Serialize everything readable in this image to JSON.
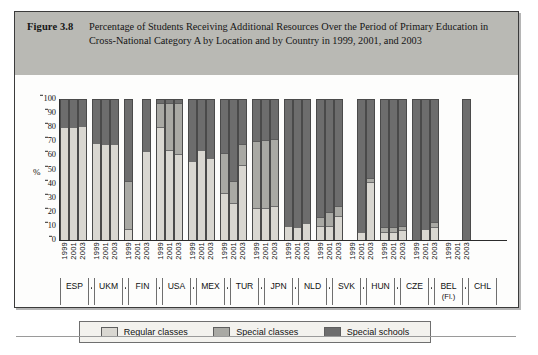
{
  "figure": {
    "number_label": "Figure 3.8",
    "title": "Percentage of Students Receiving Additional Resources Over the Period of Primary Education in Cross-National Category A by Location and by Country in 1999, 2001, and 2003"
  },
  "legend": {
    "items": [
      {
        "label": "Regular classes",
        "color": "#d9d7d1",
        "icon": "legend-swatch-icon"
      },
      {
        "label": "Special classes",
        "color": "#a9a9a4",
        "icon": "legend-swatch-icon"
      },
      {
        "label": "Special schools",
        "color": "#6d6d6d",
        "icon": "legend-swatch-icon"
      }
    ]
  },
  "chart_data": {
    "type": "bar",
    "subtype": "stacked-percentage",
    "title": "Percentage of Students Receiving Additional Resources Over the Period of Primary Education in Cross-National Category A by Location and by Country in 1999, 2001, and 2003",
    "xlabel": "",
    "ylabel": "%",
    "ylim": [
      0,
      100
    ],
    "yticks": [
      0,
      10,
      20,
      30,
      40,
      50,
      60,
      70,
      80,
      90,
      100
    ],
    "grid": false,
    "legend_position": "bottom",
    "categories": [
      "ESP",
      "UKM",
      "FIN",
      "USA",
      "MEX",
      "TUR",
      "JPN",
      "NLD",
      "SVK",
      "HUN",
      "CZE",
      "BEL (Fl.)",
      "CHL"
    ],
    "years": [
      "1999",
      "2001",
      "2003"
    ],
    "series": [
      {
        "name": "Regular classes",
        "color": "#d9d7d1"
      },
      {
        "name": "Special classes",
        "color": "#a9a9a4"
      },
      {
        "name": "Special schools",
        "color": "#6d6d6d"
      }
    ],
    "groups": [
      {
        "category": "ESP",
        "bars": [
          {
            "year": "1999",
            "regular": 80,
            "special_classes": 0,
            "special_schools": 20
          },
          {
            "year": "2001",
            "regular": 80,
            "special_classes": 0,
            "special_schools": 20
          },
          {
            "year": "2003",
            "regular": 81,
            "special_classes": 0,
            "special_schools": 19
          }
        ]
      },
      {
        "category": "UKM",
        "bars": [
          {
            "year": "1999",
            "regular": 69,
            "special_classes": 0,
            "special_schools": 31
          },
          {
            "year": "2001",
            "regular": 68,
            "special_classes": 0,
            "special_schools": 32
          },
          {
            "year": "2003",
            "regular": 68,
            "special_classes": 0,
            "special_schools": 32
          }
        ]
      },
      {
        "category": "FIN",
        "bars": [
          {
            "year": "1999",
            "regular": 8,
            "special_classes": 34,
            "special_schools": 58
          },
          {
            "year": "2001",
            "regular": 0,
            "special_classes": 0,
            "special_schools": 0
          },
          {
            "year": "2003",
            "regular": 63,
            "special_classes": 0,
            "special_schools": 37
          }
        ]
      },
      {
        "category": "USA",
        "bars": [
          {
            "year": "1999",
            "regular": 80,
            "special_classes": 17,
            "special_schools": 3
          },
          {
            "year": "2001",
            "regular": 64,
            "special_classes": 33,
            "special_schools": 3
          },
          {
            "year": "2003",
            "regular": 61,
            "special_classes": 36,
            "special_schools": 3
          }
        ]
      },
      {
        "category": "MEX",
        "bars": [
          {
            "year": "1999",
            "regular": 56,
            "special_classes": 0,
            "special_schools": 44
          },
          {
            "year": "2001",
            "regular": 64,
            "special_classes": 0,
            "special_schools": 36
          },
          {
            "year": "2003",
            "regular": 58,
            "special_classes": 0,
            "special_schools": 42
          }
        ]
      },
      {
        "category": "TUR",
        "bars": [
          {
            "year": "1999",
            "regular": 33,
            "special_classes": 29,
            "special_schools": 38
          },
          {
            "year": "2001",
            "regular": 26,
            "special_classes": 16,
            "special_schools": 58
          },
          {
            "year": "2003",
            "regular": 53,
            "special_classes": 15,
            "special_schools": 32
          }
        ]
      },
      {
        "category": "JPN",
        "bars": [
          {
            "year": "1999",
            "regular": 23,
            "special_classes": 47,
            "special_schools": 30
          },
          {
            "year": "2001",
            "regular": 23,
            "special_classes": 48,
            "special_schools": 29
          },
          {
            "year": "2003",
            "regular": 24,
            "special_classes": 48,
            "special_schools": 28
          }
        ]
      },
      {
        "category": "NLD",
        "bars": [
          {
            "year": "1999",
            "regular": 10,
            "special_classes": 0,
            "special_schools": 90
          },
          {
            "year": "2001",
            "regular": 9,
            "special_classes": 0,
            "special_schools": 91
          },
          {
            "year": "2003",
            "regular": 12,
            "special_classes": 0,
            "special_schools": 88
          }
        ]
      },
      {
        "category": "SVK",
        "bars": [
          {
            "year": "1999",
            "regular": 10,
            "special_classes": 6,
            "special_schools": 84
          },
          {
            "year": "2001",
            "regular": 10,
            "special_classes": 10,
            "special_schools": 80
          },
          {
            "year": "2003",
            "regular": 17,
            "special_classes": 7,
            "special_schools": 76
          }
        ]
      },
      {
        "category": "HUN",
        "bars": [
          {
            "year": "1999",
            "regular": 0,
            "special_classes": 0,
            "special_schools": 0
          },
          {
            "year": "2001",
            "regular": 6,
            "special_classes": 0,
            "special_schools": 94
          },
          {
            "year": "2003",
            "regular": 41,
            "special_classes": 3,
            "special_schools": 56
          }
        ]
      },
      {
        "category": "CZE",
        "bars": [
          {
            "year": "1999",
            "regular": 6,
            "special_classes": 3,
            "special_schools": 91
          },
          {
            "year": "2001",
            "regular": 6,
            "special_classes": 3,
            "special_schools": 91
          },
          {
            "year": "2003",
            "regular": 7,
            "special_classes": 3,
            "special_schools": 90
          }
        ]
      },
      {
        "category": "BEL (Fl.)",
        "bars": [
          {
            "year": "1999",
            "regular": 1,
            "special_classes": 0,
            "special_schools": 99
          },
          {
            "year": "2001",
            "regular": 8,
            "special_classes": 0,
            "special_schools": 92
          },
          {
            "year": "2003",
            "regular": 9,
            "special_classes": 4,
            "special_schools": 87
          }
        ]
      },
      {
        "category": "CHL",
        "bars": [
          {
            "year": "1999",
            "regular": 0,
            "special_classes": 0,
            "special_schools": 0
          },
          {
            "year": "2001",
            "regular": 0,
            "special_classes": 0,
            "special_schools": 0
          },
          {
            "year": "2003",
            "regular": 0,
            "special_classes": 0,
            "special_schools": 100
          }
        ]
      }
    ]
  }
}
